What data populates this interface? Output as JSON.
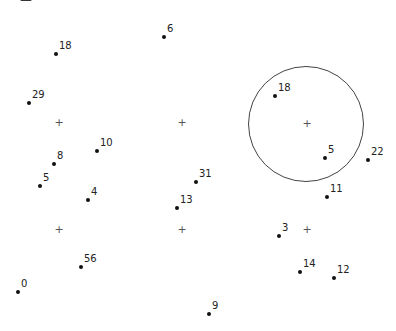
{
  "diagram": {
    "type": "clustering-scatter",
    "colors": {
      "point": "#111111",
      "label": "#222222",
      "cross": "#555555",
      "ring": "#444444"
    },
    "points": [
      {
        "label": "18",
        "x": 56,
        "y": 54
      },
      {
        "label": "6",
        "x": 164,
        "y": 37
      },
      {
        "label": "29",
        "x": 29,
        "y": 103
      },
      {
        "label": "10",
        "x": 97,
        "y": 151
      },
      {
        "label": "8",
        "x": 54,
        "y": 164
      },
      {
        "label": "5",
        "x": 40,
        "y": 186
      },
      {
        "label": "4",
        "x": 88,
        "y": 200
      },
      {
        "label": "31",
        "x": 196,
        "y": 182
      },
      {
        "label": "13",
        "x": 177,
        "y": 208
      },
      {
        "label": "56",
        "x": 81,
        "y": 267
      },
      {
        "label": "0",
        "x": 18,
        "y": 292
      },
      {
        "label": "9",
        "x": 209,
        "y": 314
      },
      {
        "label": "18",
        "x": 275,
        "y": 96
      },
      {
        "label": "5",
        "x": 325,
        "y": 158
      },
      {
        "label": "22",
        "x": 368,
        "y": 160
      },
      {
        "label": "11",
        "x": 327,
        "y": 197
      },
      {
        "label": "3",
        "x": 279,
        "y": 236
      },
      {
        "label": "14",
        "x": 300,
        "y": 272
      },
      {
        "label": "12",
        "x": 334,
        "y": 278
      }
    ],
    "centers": [
      {
        "symbol": "+",
        "x": 58,
        "y": 123
      },
      {
        "symbol": "+",
        "x": 181,
        "y": 123
      },
      {
        "symbol": "+",
        "x": 306,
        "y": 124
      },
      {
        "symbol": "+",
        "x": 58,
        "y": 230
      },
      {
        "symbol": "+",
        "x": 181,
        "y": 230
      },
      {
        "symbol": "+",
        "x": 306,
        "y": 230
      }
    ],
    "circle": {
      "cx": 306,
      "cy": 124,
      "r": 58
    }
  }
}
